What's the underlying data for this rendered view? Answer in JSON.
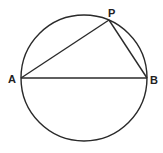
{
  "diagram": {
    "title": "",
    "circle": {
      "cx": 84,
      "cy": 78,
      "r": 63
    },
    "points": {
      "A": {
        "label": "A",
        "x": 21,
        "y": 78
      },
      "B": {
        "label": "B",
        "x": 147,
        "y": 78
      },
      "P": {
        "label": "P",
        "x": 109,
        "y": 20
      }
    },
    "segments": [
      {
        "from": "A",
        "to": "B"
      },
      {
        "from": "A",
        "to": "P"
      },
      {
        "from": "P",
        "to": "B"
      }
    ],
    "stroke_color": "#2a2a2a"
  }
}
